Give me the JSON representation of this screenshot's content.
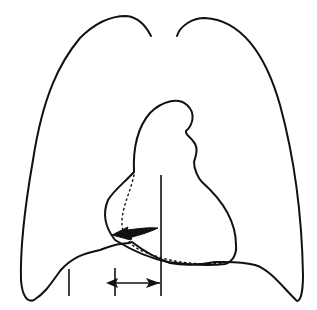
{
  "diagram": {
    "type": "anatomical line drawing",
    "background": "#ffffff",
    "stroke_color": "#111111",
    "elements": [
      {
        "name": "lung-outline",
        "style": "solid"
      },
      {
        "name": "heart-outline",
        "style": "solid"
      },
      {
        "name": "heart-inner-contour",
        "style": "dotted"
      },
      {
        "name": "midline-vertical",
        "style": "solid"
      },
      {
        "name": "left-reference-tick",
        "style": "solid"
      },
      {
        "name": "shift-arrow",
        "style": "filled, pointing left"
      },
      {
        "name": "measurement-double-arrow",
        "style": "double-headed horizontal"
      }
    ]
  }
}
